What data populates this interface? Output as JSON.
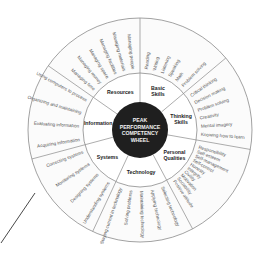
{
  "wheel": {
    "center_title_lines": [
      "PEAK",
      "PERFORMANCE",
      "COMPETENCY",
      "WHEEL"
    ],
    "colors": {
      "core": "#1f1f1f",
      "core_text": "#f2f2f2",
      "ring_stroke": "#8a8a8a",
      "item_text": "#555555"
    },
    "categories": [
      {
        "id": "basic-skills",
        "label_lines": [
          "Basic",
          "Skills"
        ],
        "items": [
          "Reading",
          "Writing",
          "Listening",
          "Speaking",
          "Math",
          "Problem solving"
        ]
      },
      {
        "id": "thinking-skills",
        "label_lines": [
          "Thinking",
          "Skills"
        ],
        "items": [
          "Critical thinking",
          "Decision making",
          "Problem solving",
          "Creativity",
          "Mental imagery",
          "Knowing how to learn"
        ]
      },
      {
        "id": "personal-qualities",
        "label_lines": [
          "Personal",
          "Qualities"
        ],
        "items": [
          "Responsibility",
          "Self-esteem",
          "Self-management",
          "Self-control",
          "Honesty",
          "Integrity",
          "Civility",
          "Motivation",
          "Sociability",
          "Positive attitude"
        ]
      },
      {
        "id": "technology",
        "label_lines": [
          "Technology"
        ],
        "items": [
          "Selecting technology",
          "Applying technology",
          "Maintaining technology",
          "Solving problems",
          "Staying current in technology"
        ]
      },
      {
        "id": "systems",
        "label_lines": [
          "Systems"
        ],
        "items": [
          "Understanding systems",
          "Designing systems",
          "Monitoring systems",
          "Correcting systems"
        ]
      },
      {
        "id": "information",
        "label_lines": [
          "Information"
        ],
        "items": [
          "Acquiring information",
          "Evaluating information",
          "Organizing and maintaining",
          "Using computers to process"
        ]
      },
      {
        "id": "resources",
        "label_lines": [
          "Resources"
        ],
        "items": [
          "Managing time",
          "Managing money",
          "Managing space",
          "Managing facilities",
          "Managing materials",
          "Managing people"
        ]
      }
    ]
  }
}
